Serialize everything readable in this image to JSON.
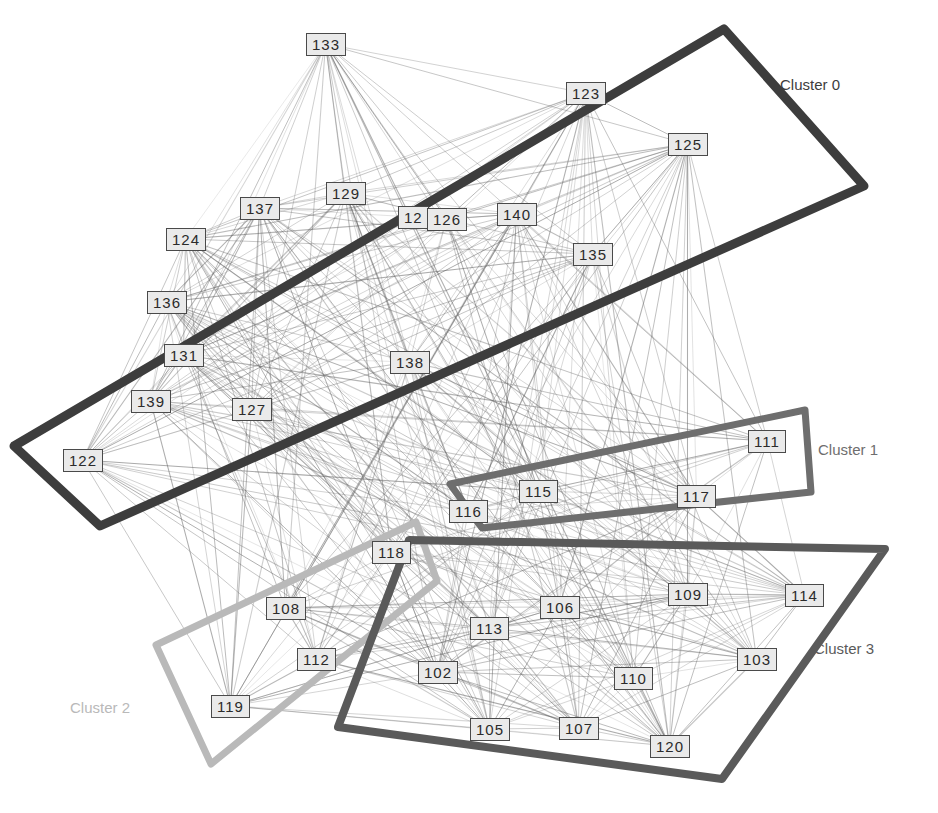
{
  "figure": {
    "type": "clustered-node-link-graph",
    "width": 938,
    "height": 813,
    "background": "#ffffff"
  },
  "nodes": [
    {
      "id": "133",
      "label": "133",
      "x": 306,
      "y": 33,
      "cluster": 0
    },
    {
      "id": "123",
      "label": "123",
      "x": 566,
      "y": 82,
      "cluster": 0
    },
    {
      "id": "125",
      "label": "125",
      "x": 668,
      "y": 133,
      "cluster": 0
    },
    {
      "id": "129",
      "label": "129",
      "x": 326,
      "y": 182,
      "cluster": 0
    },
    {
      "id": "137",
      "label": "137",
      "x": 240,
      "y": 197,
      "cluster": 0
    },
    {
      "id": "12x",
      "label": "12",
      "x": 398,
      "y": 206,
      "cluster": 0,
      "occluded": true
    },
    {
      "id": "126",
      "label": "126",
      "x": 427,
      "y": 208,
      "cluster": 0
    },
    {
      "id": "140",
      "label": "140",
      "x": 497,
      "y": 203,
      "cluster": 0
    },
    {
      "id": "124",
      "label": "124",
      "x": 166,
      "y": 228,
      "cluster": 0
    },
    {
      "id": "135",
      "label": "135",
      "x": 573,
      "y": 243,
      "cluster": 0
    },
    {
      "id": "136",
      "label": "136",
      "x": 147,
      "y": 291,
      "cluster": 0
    },
    {
      "id": "131",
      "label": "131",
      "x": 164,
      "y": 344,
      "cluster": 0
    },
    {
      "id": "138",
      "label": "138",
      "x": 390,
      "y": 351,
      "cluster": 0
    },
    {
      "id": "139",
      "label": "139",
      "x": 131,
      "y": 390,
      "cluster": 0
    },
    {
      "id": "127",
      "label": "127",
      "x": 232,
      "y": 398,
      "cluster": 0
    },
    {
      "id": "122",
      "label": "122",
      "x": 63,
      "y": 449,
      "cluster": 0
    },
    {
      "id": "111",
      "label": "111",
      "x": 748,
      "y": 430,
      "cluster": 1
    },
    {
      "id": "115",
      "label": "115",
      "x": 519,
      "y": 480,
      "cluster": 1
    },
    {
      "id": "117",
      "label": "117",
      "x": 677,
      "y": 485,
      "cluster": 1
    },
    {
      "id": "116",
      "label": "116",
      "x": 449,
      "y": 500,
      "cluster": 1
    },
    {
      "id": "118",
      "label": "118",
      "x": 372,
      "y": 541,
      "cluster": 2
    },
    {
      "id": "108",
      "label": "108",
      "x": 266,
      "y": 597,
      "cluster": 2
    },
    {
      "id": "112",
      "label": "112",
      "x": 297,
      "y": 648,
      "cluster": 2
    },
    {
      "id": "119",
      "label": "119",
      "x": 211,
      "y": 695,
      "cluster": 2
    },
    {
      "id": "109",
      "label": "109",
      "x": 668,
      "y": 583,
      "cluster": 3
    },
    {
      "id": "114",
      "label": "114",
      "x": 785,
      "y": 584,
      "cluster": 3
    },
    {
      "id": "106",
      "label": "106",
      "x": 540,
      "y": 596,
      "cluster": 3
    },
    {
      "id": "113",
      "label": "113",
      "x": 470,
      "y": 617,
      "cluster": 3
    },
    {
      "id": "103",
      "label": "103",
      "x": 737,
      "y": 648,
      "cluster": 3
    },
    {
      "id": "102",
      "label": "102",
      "x": 418,
      "y": 661,
      "cluster": 3
    },
    {
      "id": "110",
      "label": "110",
      "x": 614,
      "y": 667,
      "cluster": 3
    },
    {
      "id": "105",
      "label": "105",
      "x": 470,
      "y": 718,
      "cluster": 3
    },
    {
      "id": "107",
      "label": "107",
      "x": 559,
      "y": 717,
      "cluster": 3
    },
    {
      "id": "120",
      "label": "120",
      "x": 650,
      "y": 735,
      "cluster": 3
    }
  ],
  "clusters": [
    {
      "id": 0,
      "caption": "Cluster 0",
      "caption_x": 780,
      "caption_y": 76,
      "color": "#3d3d3d",
      "stroke_width": 9,
      "points": "724,29 864,186 100,526 14,446"
    },
    {
      "id": 1,
      "caption": "Cluster 1",
      "caption_x": 818,
      "caption_y": 441,
      "color": "#6e6e6e",
      "stroke_width": 7,
      "points": "805,410 811,492 482,528 450,484"
    },
    {
      "id": 2,
      "caption": "Cluster 2",
      "caption_x": 70,
      "caption_y": 699,
      "color": "#b9b9b9",
      "stroke_width": 7,
      "points": "416,522 437,581 211,764 156,645"
    },
    {
      "id": 3,
      "caption": "Cluster 3",
      "caption_x": 814,
      "caption_y": 640,
      "color": "#5a5a5a",
      "stroke_width": 8,
      "points": "885,549 722,779 338,727 409,540"
    }
  ],
  "edge_style": {
    "color": "#5f5f5f",
    "opacity": 0.42,
    "width": 0.7,
    "count_note": "dense all-pairs-like mesh"
  }
}
